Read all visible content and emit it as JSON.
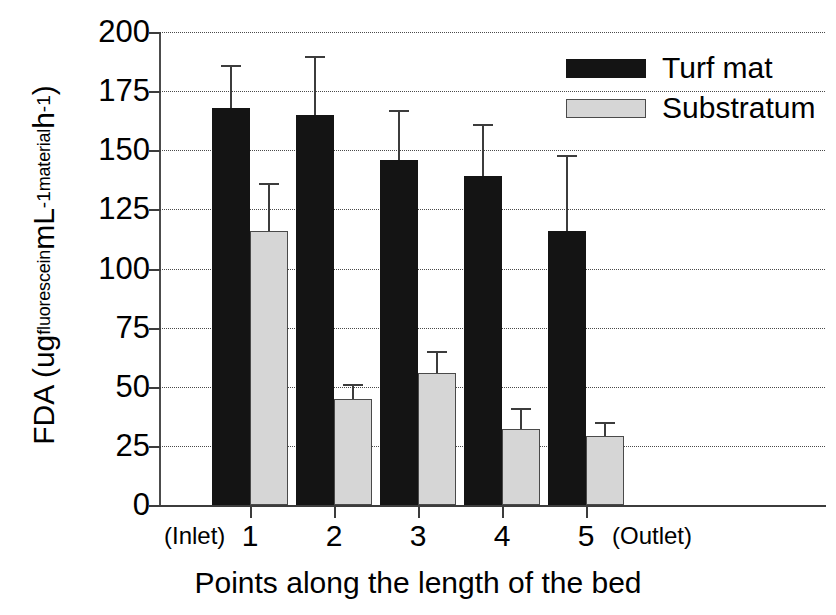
{
  "chart_data": {
    "type": "bar",
    "title": "",
    "subtitle": "",
    "xlabel": "Points along the length of the bed",
    "ylabel": "FDA (ug fluorescein mL-1 material h-1)",
    "ylabel_parts": {
      "lead": "FDA (ug",
      "sub1": "fluorescein",
      "mid": " mL",
      "sup1": "-1",
      "sub2": "material",
      "mid2": " h",
      "sup2": "-1",
      "tail": ")"
    },
    "categories": [
      "1",
      "2",
      "3",
      "4",
      "5"
    ],
    "x_edge_labels": {
      "left": "(Inlet)",
      "right": "(Outlet)"
    },
    "ylim": [
      0,
      200
    ],
    "yticks": [
      0,
      25,
      50,
      75,
      100,
      125,
      150,
      175,
      200
    ],
    "ytick_labels": [
      "0",
      "25",
      "50",
      "75",
      "100",
      "125",
      "150",
      "175",
      "200"
    ],
    "grid": true,
    "grid_style": "dotted",
    "legend_position": "top-right",
    "series": [
      {
        "name": "Turf mat",
        "color": "#141414",
        "values": [
          168,
          165,
          146,
          139,
          116
        ],
        "errors": [
          18,
          25,
          21,
          22,
          32
        ]
      },
      {
        "name": "Substratum",
        "color": "#d6d6d6",
        "values": [
          116,
          45,
          56,
          32,
          29
        ],
        "errors": [
          20,
          6,
          9,
          9,
          6
        ]
      }
    ]
  },
  "legend": {
    "items": [
      {
        "label": "Turf mat",
        "swatch": "dark"
      },
      {
        "label": "Substratum",
        "swatch": "light"
      }
    ]
  }
}
